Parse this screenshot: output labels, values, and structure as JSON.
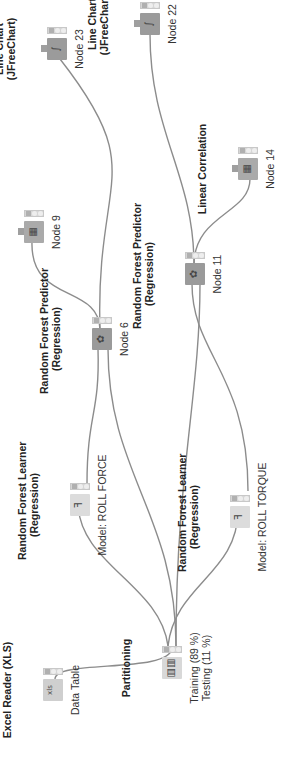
{
  "workflow": {
    "nodes": [
      {
        "id": "excel",
        "title": [
          "Excel Reader (XLS)"
        ],
        "label": [
          "Data Table"
        ],
        "icon": "excel-reader-icon",
        "glyph": "xls"
      },
      {
        "id": "part",
        "title": [
          "Partitioning"
        ],
        "label": [
          "Training (89 %)",
          "Testing (11 %)"
        ],
        "icon": "partitioning-icon",
        "glyph": "▥▥"
      },
      {
        "id": "rfl1",
        "title": [
          "Random Forest Learner",
          "(Regression)"
        ],
        "label": [
          "Model: ROLL FORCE"
        ],
        "icon": "tree-learner-icon",
        "glyph": "ꟻ"
      },
      {
        "id": "rfl2",
        "title": [
          "Random Forest Learner",
          "(Regression)"
        ],
        "label": [
          "Model: ROLL TORQUE"
        ],
        "icon": "tree-learner-icon",
        "glyph": "ꟻ"
      },
      {
        "id": "rfp1",
        "title": [
          "Random Forest Predictor",
          "(Regression)"
        ],
        "label": [
          "Node 6"
        ],
        "icon": "tree-predictor-icon",
        "glyph": "✿"
      },
      {
        "id": "rfp2",
        "title": [
          "Random Forest Predictor",
          "(Regression)"
        ],
        "label": [
          "Node 11"
        ],
        "icon": "tree-predictor-icon",
        "glyph": "✿"
      },
      {
        "id": "lc1",
        "title": [
          "Linear Correlation"
        ],
        "label": [
          "Node 9"
        ],
        "icon": "linear-correlation-icon",
        "glyph": "▦"
      },
      {
        "id": "lc2",
        "title": [
          "Linear Correlation"
        ],
        "label": [
          "Node 14"
        ],
        "icon": "linear-correlation-icon",
        "glyph": "▦"
      },
      {
        "id": "ch1",
        "title": [
          "Line Chart",
          "(JFreeChart)"
        ],
        "label": [
          "Node 23"
        ],
        "icon": "line-chart-icon",
        "glyph": "∫"
      },
      {
        "id": "ch2",
        "title": [
          "Line Chart",
          "(JFreeChart)"
        ],
        "label": [
          "Node 22"
        ],
        "icon": "line-chart-icon",
        "glyph": "∫"
      }
    ]
  },
  "colors": {
    "edge": "#8c8c8c",
    "port": "#222222"
  }
}
